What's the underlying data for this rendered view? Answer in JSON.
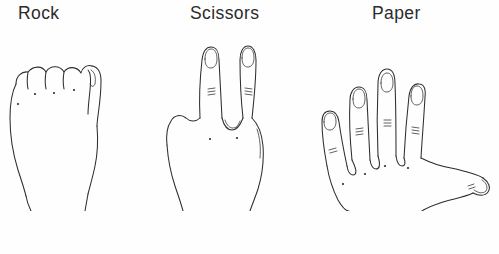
{
  "page": {
    "background_color": "#fefefe",
    "ink_color": "#2e2e2e",
    "label_color": "#2b2b2b"
  },
  "figures": [
    {
      "label": "Rock",
      "gesture": "closed-fist",
      "icon_name": "hand-rock-icon",
      "finger_count": 0,
      "description": "closed fist seen from the back, four folded knuckles and thumb at the right"
    },
    {
      "label": "Scissors",
      "gesture": "two-fingers-v",
      "icon_name": "hand-scissors-icon",
      "finger_count": 2,
      "description": "index and middle fingers extended in a V, remaining fingers folded"
    },
    {
      "label": "Paper",
      "gesture": "open-palm",
      "icon_name": "hand-paper-icon",
      "finger_count": 5,
      "description": "open hand with all five fingers spread, thumb extended to the right"
    }
  ],
  "caption": {
    "visible_fragment": ""
  }
}
